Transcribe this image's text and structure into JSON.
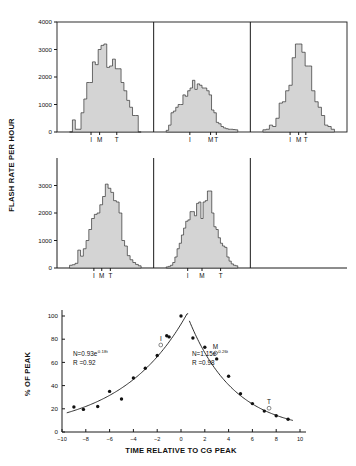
{
  "figure": {
    "top_panel": {
      "ylabel": "FLASH RATE PER HOUR",
      "yticks": [
        "0",
        "1000",
        "2000",
        "3000",
        "4000"
      ],
      "ytick_values": [
        0,
        1000,
        2000,
        3000,
        4000
      ],
      "ylim": [
        0,
        4000
      ],
      "phase_marks": [
        "I",
        "M",
        "T"
      ]
    },
    "bottom_panel": {
      "ylabel": "% OF PEAK",
      "xlabel": "TIME RELATIVE TO CG PEAK",
      "yticks": [
        "0",
        "20",
        "40",
        "60",
        "80",
        "100"
      ],
      "xticks": [
        "-10",
        "-8",
        "-6",
        "-4",
        "-2",
        "0",
        "2",
        "4",
        "6",
        "8",
        "10"
      ],
      "annotation_left_eq": "N=0.93e",
      "annotation_left_exp": "0.18t",
      "annotation_left_r": "R =0.92",
      "annotation_right_eq": "N=1.15e",
      "annotation_right_exp": "-0.26t",
      "annotation_right_r": "R =0.98",
      "marker_labels": [
        "I",
        "M",
        "T"
      ]
    }
  },
  "chart_data": [
    {
      "type": "bar",
      "title": "Flash rate histogram - storm 1 (top left)",
      "xlabel": "",
      "ylabel": "FLASH RATE PER HOUR",
      "ylim": [
        0,
        4000
      ],
      "grid": false,
      "phase_markers": {
        "I": 0.3,
        "M": 0.42,
        "T": 0.66
      },
      "values": [
        0,
        440,
        100,
        100,
        700,
        1200,
        1800,
        1800,
        2550,
        2450,
        3000,
        3150,
        3200,
        2350,
        2400,
        2650,
        2300,
        2300,
        1800,
        1500,
        1150,
        900,
        600,
        600,
        0
      ]
    },
    {
      "type": "bar",
      "title": "Flash rate histogram - storm 2 (top middle)",
      "xlabel": "",
      "ylabel": "",
      "ylim": [
        0,
        4000
      ],
      "grid": false,
      "phase_markers": {
        "I": 0.33,
        "M": 0.62,
        "T": 0.7
      },
      "values": [
        60,
        250,
        700,
        760,
        900,
        1000,
        1000,
        1350,
        1300,
        1500,
        1600,
        1880,
        1550,
        1750,
        1700,
        1600,
        1600,
        1500,
        1350,
        800,
        700,
        350,
        300,
        200,
        150,
        120,
        100,
        100,
        90,
        80
      ]
    },
    {
      "type": "bar",
      "title": "Flash rate histogram - storm 3 (top right)",
      "xlabel": "",
      "ylabel": "",
      "ylim": [
        0,
        4000
      ],
      "grid": false,
      "phase_markers": {
        "I": 0.38,
        "M": 0.5,
        "T": 0.6
      },
      "values": [
        80,
        100,
        250,
        200,
        500,
        1050,
        1100,
        1500,
        1700,
        2700,
        3200,
        3200,
        2900,
        2400,
        2400,
        1500,
        1100,
        900,
        600,
        250,
        200,
        100
      ]
    },
    {
      "type": "bar",
      "title": "Flash rate histogram - storm 4 (bottom left)",
      "xlabel": "",
      "ylabel": "FLASH RATE PER HOUR",
      "ylim": [
        0,
        4000
      ],
      "grid": false,
      "phase_markers": {
        "I": 0.34,
        "M": 0.45,
        "T": 0.57
      },
      "values": [
        100,
        120,
        170,
        650,
        430,
        700,
        1000,
        1400,
        1800,
        1950,
        2000,
        2300,
        2600,
        3050,
        2900,
        2750,
        2450,
        2400,
        2000,
        1000,
        800,
        450,
        300,
        200,
        130,
        80
      ]
    },
    {
      "type": "bar",
      "title": "Flash rate histogram - storm 5 (bottom middle)",
      "xlabel": "",
      "ylabel": "",
      "ylim": [
        0,
        4000
      ],
      "grid": false,
      "phase_markers": {
        "I": 0.3,
        "M": 0.5,
        "T": 0.76
      },
      "values": [
        40,
        60,
        100,
        200,
        400,
        700,
        900,
        1200,
        1450,
        1700,
        1750,
        2050,
        2050,
        1900,
        2350,
        2400,
        1800,
        2400,
        2450,
        2800,
        2800,
        2000,
        1500,
        1400,
        1100,
        900,
        800,
        750,
        400,
        250,
        150,
        100,
        80
      ]
    },
    {
      "type": "scatter",
      "title": "Normalized flash rate vs time relative to CG peak",
      "xlabel": "TIME RELATIVE TO CG PEAK",
      "ylabel": "% OF PEAK",
      "xlim": [
        -10,
        10
      ],
      "ylim": [
        0,
        100
      ],
      "grid": false,
      "points": [
        {
          "x": -9.0,
          "y": 21.5
        },
        {
          "x": -8.2,
          "y": 19.5
        },
        {
          "x": -7.0,
          "y": 22.0
        },
        {
          "x": -6.0,
          "y": 35.0
        },
        {
          "x": -5.0,
          "y": 28.5
        },
        {
          "x": -4.0,
          "y": 46.5
        },
        {
          "x": -3.0,
          "y": 55.0
        },
        {
          "x": -2.0,
          "y": 66.0
        },
        {
          "x": -1.2,
          "y": 83.0
        },
        {
          "x": -1.0,
          "y": 82.0
        },
        {
          "x": 0.0,
          "y": 100.0
        },
        {
          "x": 1.0,
          "y": 81.0
        },
        {
          "x": 2.0,
          "y": 73.0
        },
        {
          "x": 3.0,
          "y": 63.0
        },
        {
          "x": 4.0,
          "y": 48.0
        },
        {
          "x": 5.0,
          "y": 33.0
        },
        {
          "x": 6.0,
          "y": 24.5
        },
        {
          "x": 7.0,
          "y": 18.0
        },
        {
          "x": 8.0,
          "y": 14.0
        },
        {
          "x": 9.0,
          "y": 11.0
        }
      ],
      "open_markers": [
        {
          "label": "I",
          "x": -1.7,
          "y": 75.0
        },
        {
          "label": "M",
          "x": 2.9,
          "y": 68.0
        },
        {
          "label": "T",
          "x": 7.4,
          "y": 20.5
        }
      ],
      "fit_left": {
        "equation": "N=0.93e^0.18t",
        "a": 0.93,
        "b": 0.18,
        "r": 0.92
      },
      "fit_right": {
        "equation": "N=1.15e^-0.26t",
        "a": 1.15,
        "b": -0.26,
        "r": 0.98
      }
    }
  ]
}
